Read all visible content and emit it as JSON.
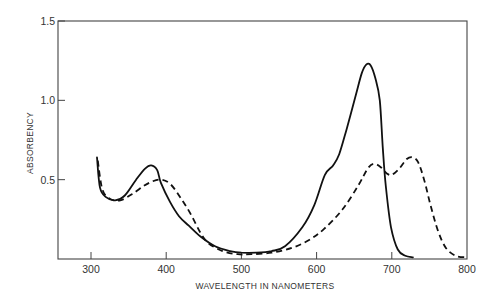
{
  "chart_data": {
    "type": "line",
    "title": "",
    "xlabel": "WAVELENGTH IN NANOMETERS",
    "ylabel": "ABSORBENCY",
    "xlim": [
      256,
      800
    ],
    "ylim": [
      0,
      1.5
    ],
    "x_ticks": [
      300,
      400,
      500,
      600,
      700,
      800
    ],
    "x_tick_labels": [
      "300",
      "400",
      "500",
      "600",
      "700",
      "800"
    ],
    "y_ticks": [
      0.5,
      1.0,
      1.5
    ],
    "y_tick_labels": [
      "0.5",
      "1.0",
      "1.5"
    ],
    "grid": false,
    "legend": null,
    "series": [
      {
        "name": "solid",
        "style": "solid",
        "color": "#111111",
        "points": [
          [
            308,
            0.64
          ],
          [
            312,
            0.45
          ],
          [
            320,
            0.39
          ],
          [
            332,
            0.37
          ],
          [
            345,
            0.4
          ],
          [
            360,
            0.5
          ],
          [
            372,
            0.57
          ],
          [
            380,
            0.59
          ],
          [
            388,
            0.56
          ],
          [
            393,
            0.48
          ],
          [
            405,
            0.36
          ],
          [
            417,
            0.27
          ],
          [
            430,
            0.21
          ],
          [
            446,
            0.14
          ],
          [
            465,
            0.08
          ],
          [
            485,
            0.05
          ],
          [
            500,
            0.04
          ],
          [
            520,
            0.04
          ],
          [
            540,
            0.05
          ],
          [
            558,
            0.08
          ],
          [
            581,
            0.2
          ],
          [
            597,
            0.34
          ],
          [
            611,
            0.53
          ],
          [
            622,
            0.59
          ],
          [
            630,
            0.66
          ],
          [
            640,
            0.82
          ],
          [
            652,
            1.03
          ],
          [
            660,
            1.17
          ],
          [
            666,
            1.225
          ],
          [
            672,
            1.22
          ],
          [
            678,
            1.14
          ],
          [
            684,
            1.0
          ],
          [
            688,
            0.7
          ],
          [
            692,
            0.46
          ],
          [
            699,
            0.2
          ],
          [
            708,
            0.06
          ],
          [
            718,
            0.02
          ],
          [
            728,
            0.01
          ]
        ]
      },
      {
        "name": "dashed",
        "style": "dashed",
        "color": "#111111",
        "points": [
          [
            309,
            0.62
          ],
          [
            315,
            0.44
          ],
          [
            325,
            0.38
          ],
          [
            339,
            0.37
          ],
          [
            355,
            0.41
          ],
          [
            370,
            0.46
          ],
          [
            382,
            0.49
          ],
          [
            394,
            0.5
          ],
          [
            406,
            0.47
          ],
          [
            420,
            0.38
          ],
          [
            433,
            0.28
          ],
          [
            445,
            0.17
          ],
          [
            456,
            0.1
          ],
          [
            475,
            0.05
          ],
          [
            495,
            0.03
          ],
          [
            513,
            0.03
          ],
          [
            540,
            0.04
          ],
          [
            567,
            0.07
          ],
          [
            590,
            0.12
          ],
          [
            610,
            0.19
          ],
          [
            634,
            0.31
          ],
          [
            655,
            0.46
          ],
          [
            668,
            0.57
          ],
          [
            676,
            0.6
          ],
          [
            685,
            0.58
          ],
          [
            693,
            0.54
          ],
          [
            700,
            0.53
          ],
          [
            710,
            0.57
          ],
          [
            720,
            0.63
          ],
          [
            728,
            0.64
          ],
          [
            735,
            0.61
          ],
          [
            743,
            0.5
          ],
          [
            752,
            0.33
          ],
          [
            762,
            0.17
          ],
          [
            772,
            0.07
          ],
          [
            785,
            0.02
          ],
          [
            800,
            0.01
          ]
        ]
      }
    ]
  }
}
